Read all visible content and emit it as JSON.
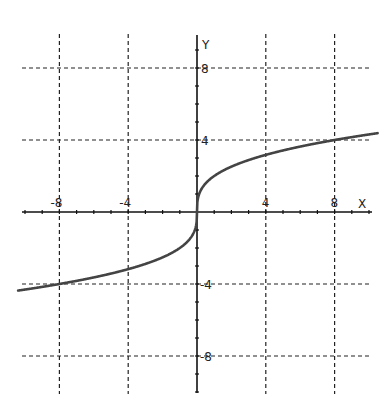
{
  "chart_data": {
    "type": "line",
    "title": "",
    "xlabel": "X",
    "ylabel": "Y",
    "xlim": [
      -10,
      10
    ],
    "ylim": [
      -10,
      10
    ],
    "grid": true,
    "grid_style": "dashed",
    "x_ticks": [
      -8,
      -4,
      4,
      8
    ],
    "y_ticks": [
      8,
      4,
      -4,
      -8
    ],
    "x_tick_labels": [
      "-8",
      "-4",
      "4",
      "8"
    ],
    "y_tick_labels": [
      "8",
      "4",
      "-4",
      "-8"
    ],
    "series": [
      {
        "name": "y = 2·∛x",
        "x": [
          -10,
          -8,
          -6,
          -4,
          -2,
          -1,
          -0.5,
          -0.1,
          0,
          0.1,
          0.5,
          1,
          2,
          4,
          6,
          8,
          10
        ],
        "y": [
          -4.31,
          -4.0,
          -3.63,
          -3.17,
          -2.52,
          -2.0,
          -1.59,
          -0.93,
          0,
          0.93,
          1.59,
          2.0,
          2.52,
          3.17,
          3.63,
          4.0,
          4.31
        ]
      }
    ],
    "colors": {
      "curve": "#444444",
      "axis": "#111111",
      "grid": "#222222"
    }
  }
}
